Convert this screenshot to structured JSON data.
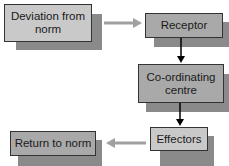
{
  "diagram": {
    "type": "flowchart",
    "nodes": [
      {
        "id": "deviation",
        "label": "Deviation from norm"
      },
      {
        "id": "receptor",
        "label": "Receptor"
      },
      {
        "id": "coordinating",
        "label": "Co-ordinating centre"
      },
      {
        "id": "effectors",
        "label": "Effectors"
      },
      {
        "id": "return",
        "label": "Return to norm"
      }
    ],
    "edges": [
      {
        "from": "deviation",
        "to": "receptor",
        "color": "#a0a0a0"
      },
      {
        "from": "receptor",
        "to": "coordinating",
        "color": "#000000"
      },
      {
        "from": "coordinating",
        "to": "effectors",
        "color": "#000000"
      },
      {
        "from": "effectors",
        "to": "return",
        "color": "#a0a0a0"
      }
    ]
  },
  "labels": {
    "deviation_line1": "Deviation from",
    "deviation_line2": "norm",
    "receptor": "Receptor",
    "coordinating_line1": "Co-ordinating",
    "coordinating_line2": "centre",
    "effectors": "Effectors",
    "return": "Return to norm"
  }
}
